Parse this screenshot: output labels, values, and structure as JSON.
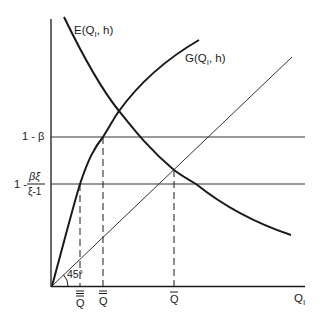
{
  "diagram": {
    "curves": {
      "E": {
        "label": "E(Q",
        "sub": "I",
        "tail": ", h)"
      },
      "G": {
        "label": "G(Q",
        "sub": "I",
        "tail": ", h)"
      }
    },
    "axes": {
      "x_label": "Q",
      "x_sub": "I",
      "angle_label": "45°"
    },
    "y_levels": {
      "upper": {
        "label": "1 - β"
      },
      "lower": {
        "prefix": "1 -",
        "numerator": "βξ",
        "denominator": "ξ-1"
      }
    },
    "x_marks": [
      {
        "label": "Q",
        "bars": 3
      },
      {
        "label": "Q",
        "bars": 2
      },
      {
        "label": "Q",
        "bars": 1
      }
    ],
    "colors": {
      "ink": "#1a1a1a",
      "thin": "#333333",
      "background": "#ffffff"
    }
  }
}
